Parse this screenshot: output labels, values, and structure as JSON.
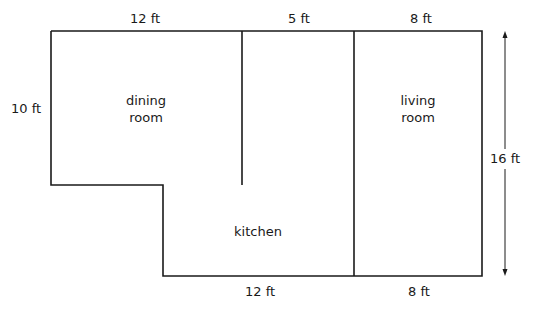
{
  "diagram": {
    "type": "floor-plan",
    "rooms": [
      {
        "name_line1": "dining",
        "name_line2": "room"
      },
      {
        "name_line1": "kitchen"
      },
      {
        "name_line1": "living",
        "name_line2": "room"
      }
    ],
    "dimensions": {
      "top_dining": "12 ft",
      "top_middle": "5 ft",
      "top_living": "8 ft",
      "left_dining": "10 ft",
      "right_total": "16 ft",
      "bottom_kitchen": "12 ft",
      "bottom_living": "8 ft"
    },
    "colors": {
      "line": "#1a1a1a",
      "background": "#ffffff"
    }
  }
}
